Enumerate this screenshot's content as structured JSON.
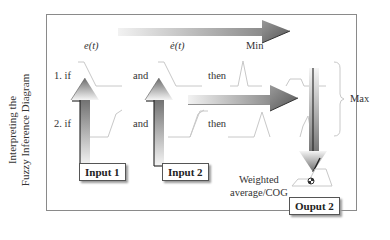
{
  "side_title": {
    "line1": "Interpreting the",
    "line2": "Fuzzy Inference Diagram"
  },
  "columns": {
    "input1_var": "e(t)",
    "input2_var": "ė(t)"
  },
  "rules": [
    {
      "prefix": "1. if",
      "connector": "and",
      "consequent": "then"
    },
    {
      "prefix": "2. if",
      "connector": "and",
      "consequent": "then"
    }
  ],
  "operators": {
    "min": "Min",
    "max": "Max"
  },
  "boxes": {
    "input1": "Input 1",
    "input2": "Input 2",
    "output": "Ouput 2"
  },
  "defuzz": {
    "line1": "Weighted",
    "line2": "average/COG"
  },
  "colors": {
    "arrow_dark": "#6e6e6e",
    "arrow_light": "#f0f0f0",
    "mf_line": "#c8c8c8",
    "frame": "#8a8a8a"
  }
}
